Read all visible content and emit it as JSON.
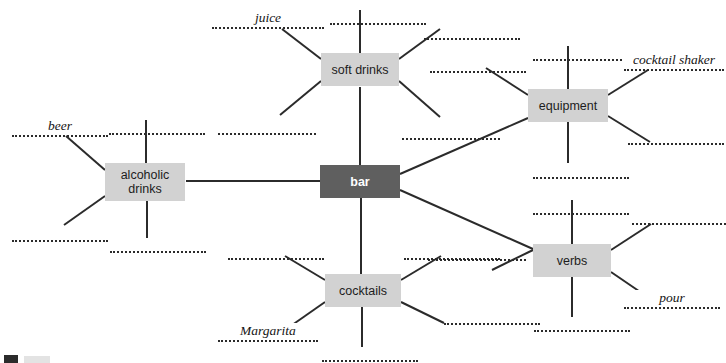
{
  "diagram": {
    "type": "mind-map",
    "title": "bar",
    "center": {
      "label": "bar",
      "x": 320,
      "y": 165,
      "w": 80,
      "h": 33,
      "style": "dark"
    },
    "branches": [
      {
        "id": "soft-drinks",
        "label": "soft drinks",
        "x": 321,
        "y": 53,
        "w": 78,
        "h": 33,
        "style": "light"
      },
      {
        "id": "alcoholic-drinks",
        "label": "alcoholic\ndrinks",
        "x": 105,
        "y": 163,
        "w": 80,
        "h": 38,
        "style": "light"
      },
      {
        "id": "equipment",
        "label": "equipment",
        "x": 528,
        "y": 89,
        "w": 80,
        "h": 33,
        "style": "light"
      },
      {
        "id": "cocktails",
        "label": "cocktails",
        "x": 325,
        "y": 274,
        "w": 76,
        "h": 33,
        "style": "light"
      },
      {
        "id": "verbs",
        "label": "verbs",
        "x": 533,
        "y": 244,
        "w": 78,
        "h": 33,
        "style": "light"
      }
    ],
    "examples": [
      {
        "id": "ex-juice",
        "text": "juice",
        "parent": "soft-drinks"
      },
      {
        "id": "ex-beer",
        "text": "beer",
        "parent": "alcoholic-drinks"
      },
      {
        "id": "ex-cocktail-shaker",
        "text": "cocktail shaker",
        "parent": "equipment"
      },
      {
        "id": "ex-margarita",
        "text": "Margarita",
        "parent": "cocktails"
      },
      {
        "id": "ex-pour",
        "text": "pour",
        "parent": "verbs"
      }
    ],
    "blanks": [
      {
        "id": "b-juice",
        "parent": "soft-drinks",
        "x": 212,
        "y": 12,
        "w": 112,
        "label": "juice"
      },
      {
        "id": "b-sd-top",
        "parent": "soft-drinks",
        "x": 330,
        "y": 8,
        "w": 96,
        "label": ""
      },
      {
        "id": "b-sd-ur",
        "parent": "soft-drinks",
        "x": 424,
        "y": 23,
        "w": 96,
        "label": ""
      },
      {
        "id": "b-sd-ll",
        "parent": "soft-drinks",
        "x": 218,
        "y": 118,
        "w": 98,
        "label": ""
      },
      {
        "id": "b-sd-lr",
        "parent": "soft-drinks",
        "x": 402,
        "y": 123,
        "w": 98,
        "label": ""
      },
      {
        "id": "b-beer",
        "parent": "alcoholic-drinks",
        "x": 12,
        "y": 120,
        "w": 96,
        "label": "beer"
      },
      {
        "id": "b-ad-top",
        "parent": "alcoholic-drinks",
        "x": 109,
        "y": 118,
        "w": 96,
        "label": ""
      },
      {
        "id": "b-ad-ll",
        "parent": "alcoholic-drinks",
        "x": 12,
        "y": 225,
        "w": 96,
        "label": ""
      },
      {
        "id": "b-ad-bot",
        "parent": "alcoholic-drinks",
        "x": 110,
        "y": 236,
        "w": 96,
        "label": ""
      },
      {
        "id": "b-eq-top",
        "parent": "equipment",
        "x": 533,
        "y": 44,
        "w": 96,
        "label": ""
      },
      {
        "id": "b-shaker",
        "parent": "equipment",
        "x": 624,
        "y": 54,
        "w": 100,
        "label": "cocktail shaker"
      },
      {
        "id": "b-eq-ul",
        "parent": "equipment",
        "x": 430,
        "y": 56,
        "w": 96,
        "label": ""
      },
      {
        "id": "b-eq-lr",
        "parent": "equipment",
        "x": 628,
        "y": 128,
        "w": 96,
        "label": ""
      },
      {
        "id": "b-eq-bot",
        "parent": "equipment",
        "x": 533,
        "y": 162,
        "w": 96,
        "label": ""
      },
      {
        "id": "b-ck-ul",
        "parent": "cocktails",
        "x": 228,
        "y": 243,
        "w": 96,
        "label": ""
      },
      {
        "id": "b-ck-ur",
        "parent": "cocktails",
        "x": 404,
        "y": 243,
        "w": 96,
        "label": ""
      },
      {
        "id": "b-margarita",
        "parent": "cocktails",
        "x": 218,
        "y": 325,
        "w": 100,
        "label": "Margarita"
      },
      {
        "id": "b-ck-bot",
        "parent": "cocktails",
        "x": 322,
        "y": 345,
        "w": 96,
        "label": ""
      },
      {
        "id": "b-vb-top",
        "parent": "verbs",
        "x": 533,
        "y": 198,
        "w": 96,
        "label": ""
      },
      {
        "id": "b-vb-ur",
        "parent": "verbs",
        "x": 632,
        "y": 208,
        "w": 94,
        "label": ""
      },
      {
        "id": "b-vb-ul",
        "parent": "verbs",
        "x": 428,
        "y": 244,
        "w": 98,
        "label": ""
      },
      {
        "id": "b-pour",
        "parent": "verbs",
        "x": 624,
        "y": 292,
        "w": 96,
        "label": "pour"
      },
      {
        "id": "b-vb-bot",
        "parent": "verbs",
        "x": 534,
        "y": 315,
        "w": 96,
        "label": ""
      },
      {
        "id": "b-ck-re",
        "parent": "cocktails",
        "x": 444,
        "y": 308,
        "w": 96,
        "label": ""
      }
    ],
    "colors": {
      "node_light": "#d2d2d2",
      "node_dark": "#5f5f5f",
      "node_dark_text": "#ffffff",
      "node_light_text": "#1d1d1d",
      "line": "#2b2b2b",
      "blank_dots": "#2b2b2b",
      "background": "#ffffff"
    }
  }
}
